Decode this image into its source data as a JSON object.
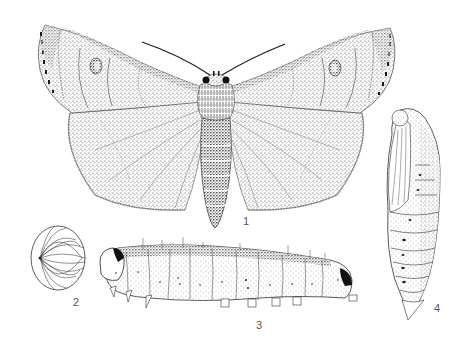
{
  "plate": {
    "type": "scientific illustration plate",
    "subject": "moth life cycle",
    "figures": [
      {
        "number": "1",
        "label": "1",
        "depicts": "adult moth, wings spread"
      },
      {
        "number": "2",
        "label": "2",
        "depicts": "egg"
      },
      {
        "number": "3",
        "label": "3",
        "depicts": "larva (caterpillar), lateral view"
      },
      {
        "number": "4",
        "label": "4",
        "depicts": "pupa, lateral view"
      }
    ]
  },
  "colors": {
    "background": "#ffffff",
    "ink": "#1a1a1a",
    "stipple": "#444444",
    "label": "#555555"
  }
}
